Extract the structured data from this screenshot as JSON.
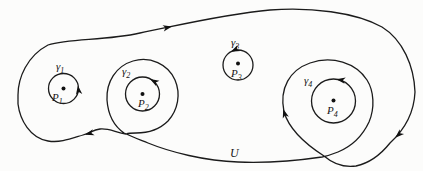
{
  "figure": {
    "background": "#fcfcfb",
    "stroke_color": "#1b1b1b",
    "labels": {
      "gamma1": {
        "base": "γ",
        "sub": "1"
      },
      "gamma2": {
        "base": "γ",
        "sub": "2"
      },
      "gamma3": {
        "base": "γ",
        "sub": "3"
      },
      "gamma4": {
        "base": "γ",
        "sub": "4"
      },
      "p1": {
        "base": "P",
        "sub": "1"
      },
      "p2": {
        "base": "P",
        "sub": "2"
      },
      "p3": {
        "base": "P",
        "sub": "3"
      },
      "p4": {
        "base": "P",
        "sub": "4"
      },
      "region": "U"
    }
  }
}
